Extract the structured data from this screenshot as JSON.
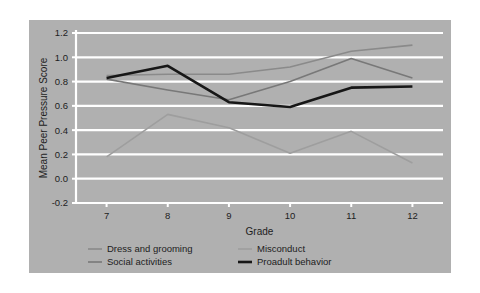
{
  "figure": {
    "background_color": "#ffffff",
    "panel_color": "#b0b0b0",
    "gridline_color": "#ffffff",
    "axis_color": "#ffffff",
    "text_color": "#1d1d1d"
  },
  "chart_data": {
    "type": "line",
    "title": "",
    "subtitle": "",
    "xlabel": "Grade",
    "ylabel": "Mean Peer Pressure Score",
    "categories": [
      "7",
      "8",
      "9",
      "10",
      "11",
      "12"
    ],
    "x": [
      7,
      8,
      9,
      10,
      11,
      12
    ],
    "xlim": [
      6.5,
      12.5
    ],
    "ylim": [
      -0.2,
      1.2
    ],
    "yticks": [
      "1.2",
      "1.0",
      "0.8",
      "0.6",
      "0.4",
      "0.2",
      "0.0",
      "-0.2"
    ],
    "ytick_values": [
      1.2,
      1.0,
      0.8,
      0.6,
      0.4,
      0.2,
      0.0,
      -0.2
    ],
    "xticks": [
      "7",
      "8",
      "9",
      "10",
      "11",
      "12"
    ],
    "grid": "horizontal",
    "legend_position": "below-plot",
    "legend_columns": 2,
    "series": [
      {
        "name": "Dress and grooming",
        "color": "#8a8a8a",
        "width": 1.6,
        "values": [
          0.85,
          0.86,
          0.86,
          0.92,
          1.05,
          1.1
        ]
      },
      {
        "name": "Misconduct",
        "color": "#9e9e9e",
        "width": 1.6,
        "values": [
          0.18,
          0.53,
          0.42,
          0.21,
          0.39,
          0.13
        ]
      },
      {
        "name": "Social activities",
        "color": "#787878",
        "width": 1.6,
        "values": [
          0.82,
          0.73,
          0.65,
          0.8,
          0.99,
          0.83
        ]
      },
      {
        "name": "Proadult behavior",
        "color": "#171717",
        "width": 2.6,
        "values": [
          0.83,
          0.93,
          0.63,
          0.59,
          0.75,
          0.76
        ]
      }
    ]
  },
  "legend": {
    "entries": [
      {
        "label": "Dress and grooming",
        "color": "#8a8a8a",
        "width": 1.6
      },
      {
        "label": "Misconduct",
        "color": "#9e9e9e",
        "width": 1.6
      },
      {
        "label": "Social activities",
        "color": "#787878",
        "width": 1.6
      },
      {
        "label": "Proadult behavior",
        "color": "#171717",
        "width": 2.6
      }
    ]
  }
}
